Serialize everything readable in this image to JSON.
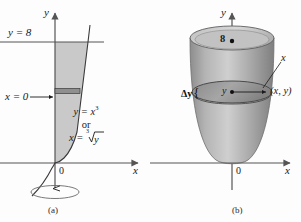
{
  "figure": {
    "background": "#fdfdfd",
    "ink": "#1a1a1a"
  },
  "panel_a": {
    "caption": "(a)",
    "axis_y_label": "y",
    "axis_x_label": "x",
    "origin_label": "0",
    "labels": {
      "top_line": "y = 8",
      "left_bound": "x = 0",
      "curve_line1": "y = x",
      "curve_line1_exp": "3",
      "curve_or": "or",
      "curve_line2_lhs": "x = ",
      "curve_line2_radical": "y",
      "curve_line2_index": "3"
    },
    "colors": {
      "region_fill": "#c9c9c9",
      "strip_fill": "#8f8f8f",
      "curve": "#3a3a3a",
      "axis": "#555555"
    },
    "geometry": {
      "y_equals_8_px": 42,
      "strip_center_px": 91,
      "strip_height_px": 5,
      "origin_px": [
        55,
        163
      ]
    }
  },
  "panel_b": {
    "caption": "(b)",
    "axis_y_label": "y",
    "axis_x_label": "x",
    "origin_label": "0",
    "labels": {
      "height_mark": "8",
      "delta_y": "Δy",
      "brace": "{",
      "radius": "x",
      "center": "y",
      "point": "(x, y)"
    },
    "colors": {
      "solid_light": "#d2d2d2",
      "solid_mid": "#a8a8a8",
      "solid_dark": "#7d7d7d",
      "disk_fill": "#9a9a9a",
      "outline": "#4a4a4a",
      "axis": "#555555"
    },
    "geometry": {
      "top_ellipse_y_px": 38,
      "disk_ellipse_y_px": 92,
      "origin_px": [
        232,
        163
      ]
    }
  }
}
